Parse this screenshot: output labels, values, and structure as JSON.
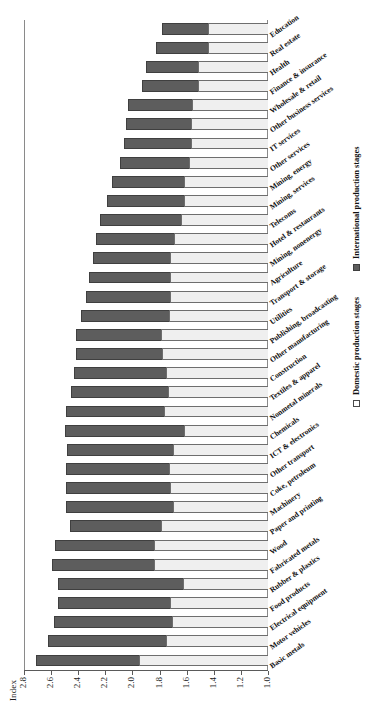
{
  "chart_data": {
    "type": "bar",
    "stacked": true,
    "orientation": "vertical-rotated",
    "title": "",
    "xlabel": "",
    "ylabel": "Index",
    "ylim": [
      1.0,
      2.8
    ],
    "yticks": [
      "2.8",
      "2.6",
      "2.4",
      "2.2",
      "2.0",
      "1.8",
      "1.6",
      "1.4",
      "1.2",
      "1.0"
    ],
    "ytick_values": [
      2.8,
      2.6,
      2.4,
      2.2,
      2.0,
      1.8,
      1.6,
      1.4,
      1.2,
      1.0
    ],
    "grid": false,
    "legend_position": "bottom-right",
    "baseline": 1.0,
    "categories": [
      "Basic metals",
      "Motor vehicles",
      "Electrical equipment",
      "Food products",
      "Rubber & plastics",
      "Fabricated metals",
      "Wood",
      "Paper and printing",
      "Machinery",
      "Coke, petroleum",
      "Other transport",
      "ICT & electronics",
      "Chemicals",
      "Nonmetal minerals",
      "Textiles & apparel",
      "Construction",
      "Other manufacturing",
      "Publishing, broadcasting",
      "Utilities",
      "Transport & storage",
      "Agriculture",
      "Mining, nonenergy",
      "Hotel & restaurants",
      "Telecoms",
      "Mining, services",
      "Mining, energy",
      "Other services",
      "IT services",
      "Other business services",
      "Wholesale & retail",
      "Finance & insurance",
      "Health",
      "Real estate",
      "Education"
    ],
    "series": [
      {
        "name": "Domestic production stages",
        "color": "#efefef",
        "values": [
          1.95,
          1.75,
          1.71,
          1.72,
          1.63,
          1.84,
          1.84,
          1.79,
          1.7,
          1.72,
          1.73,
          1.7,
          1.62,
          1.77,
          1.74,
          1.75,
          1.78,
          1.79,
          1.73,
          1.72,
          1.72,
          1.72,
          1.69,
          1.64,
          1.62,
          1.62,
          1.58,
          1.57,
          1.57,
          1.56,
          1.52,
          1.52,
          1.44,
          1.44
        ]
      },
      {
        "name": "International production stages",
        "color": "#5d5d5d",
        "values": [
          0.76,
          0.87,
          0.87,
          0.83,
          0.92,
          0.75,
          0.73,
          0.67,
          0.79,
          0.77,
          0.76,
          0.78,
          0.88,
          0.72,
          0.71,
          0.68,
          0.64,
          0.63,
          0.65,
          0.62,
          0.6,
          0.57,
          0.58,
          0.6,
          0.57,
          0.53,
          0.51,
          0.49,
          0.48,
          0.47,
          0.41,
          0.38,
          0.39,
          0.34
        ]
      }
    ],
    "totals": [
      2.71,
      2.62,
      2.58,
      2.55,
      2.55,
      2.59,
      2.57,
      2.46,
      2.49,
      2.49,
      2.49,
      2.48,
      2.5,
      2.49,
      2.45,
      2.43,
      2.42,
      2.42,
      2.38,
      2.34,
      2.32,
      2.29,
      2.27,
      2.24,
      2.19,
      2.15,
      2.09,
      2.06,
      2.05,
      2.03,
      1.93,
      1.9,
      1.83,
      1.78
    ]
  },
  "legend": {
    "items": [
      {
        "label": "Domestic production stages",
        "swatch": "open-square"
      },
      {
        "label": "International production stages",
        "swatch": "filled-square"
      }
    ]
  }
}
